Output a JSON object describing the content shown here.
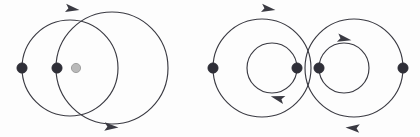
{
  "figure": {
    "background_color": "#fdfdfd",
    "stroke_color": "#3a3a42",
    "filled_node_color": "#2f2f38",
    "hollow_node_color": "#b9b9b9",
    "hollow_node_border_color": "#9a9a9a",
    "width": 420,
    "height": 137,
    "panels": [
      {
        "id": "left-panel",
        "name": "left-diagram",
        "circles": [
          {
            "id": "left-outer-a",
            "name": "circle-left-large",
            "cx": 70,
            "cy": 68,
            "r": 48,
            "direction": "clockwise"
          },
          {
            "id": "left-outer-b",
            "name": "circle-right-large",
            "cx": 112,
            "cy": 68,
            "r": 56,
            "direction": "clockwise"
          }
        ],
        "nodes": [
          {
            "id": "l-node-1",
            "name": "node-filled-left",
            "cx": 22,
            "cy": 68,
            "r": 5.2,
            "style": "filled"
          },
          {
            "id": "l-node-2",
            "name": "node-filled-mid",
            "cx": 57,
            "cy": 68,
            "r": 5.2,
            "style": "filled"
          },
          {
            "id": "l-node-3",
            "name": "node-hollow-right",
            "cx": 76,
            "cy": 68,
            "r": 4.6,
            "style": "hollow"
          }
        ],
        "arrows": [
          {
            "id": "l-arrow-top",
            "name": "arrow-top-right",
            "x": 73,
            "y": 9,
            "angle": 8,
            "points": "right"
          },
          {
            "id": "l-arrow-bottom",
            "name": "arrow-bottom-right",
            "x": 112,
            "y": 127,
            "angle": 4,
            "points": "right"
          }
        ]
      },
      {
        "id": "right-panel",
        "name": "right-diagram",
        "circles": [
          {
            "id": "r-outer-a",
            "name": "circle-outer-left",
            "cx": 262,
            "cy": 68,
            "r": 49,
            "direction": "clockwise"
          },
          {
            "id": "r-outer-b",
            "name": "circle-outer-right",
            "cx": 354,
            "cy": 68,
            "r": 49,
            "direction": "counter-clockwise"
          },
          {
            "id": "r-inner-a",
            "name": "circle-inner-left",
            "cx": 272,
            "cy": 68,
            "r": 25,
            "direction": "counter-clockwise"
          },
          {
            "id": "r-inner-b",
            "name": "circle-inner-right",
            "cx": 344,
            "cy": 68,
            "r": 25,
            "direction": "clockwise"
          }
        ],
        "nodes": [
          {
            "id": "r-node-1",
            "name": "node-filled-far-left",
            "cx": 213,
            "cy": 68,
            "r": 5.2,
            "style": "filled"
          },
          {
            "id": "r-node-2",
            "name": "node-filled-center-left",
            "cx": 297,
            "cy": 68,
            "r": 5.2,
            "style": "filled"
          },
          {
            "id": "r-node-3",
            "name": "node-filled-center-right",
            "cx": 319,
            "cy": 68,
            "r": 5.2,
            "style": "filled"
          },
          {
            "id": "r-node-4",
            "name": "node-filled-far-right",
            "cx": 403,
            "cy": 68,
            "r": 5.2,
            "style": "filled"
          }
        ],
        "arrows": [
          {
            "id": "r-arrow-outer-top",
            "name": "arrow-outer-left-top-right",
            "x": 269,
            "y": 9,
            "angle": 8,
            "points": "right"
          },
          {
            "id": "r-arrow-outer-bottom",
            "name": "arrow-outer-right-bottom-left",
            "x": 352,
            "y": 128,
            "angle": 184,
            "points": "left"
          },
          {
            "id": "r-arrow-inner-left",
            "name": "arrow-inner-left-bottom-left",
            "x": 277,
            "y": 98,
            "angle": 196,
            "points": "left"
          },
          {
            "id": "r-arrow-inner-right",
            "name": "arrow-inner-right-top-right",
            "x": 345,
            "y": 39,
            "angle": 10,
            "points": "right"
          }
        ]
      }
    ]
  }
}
